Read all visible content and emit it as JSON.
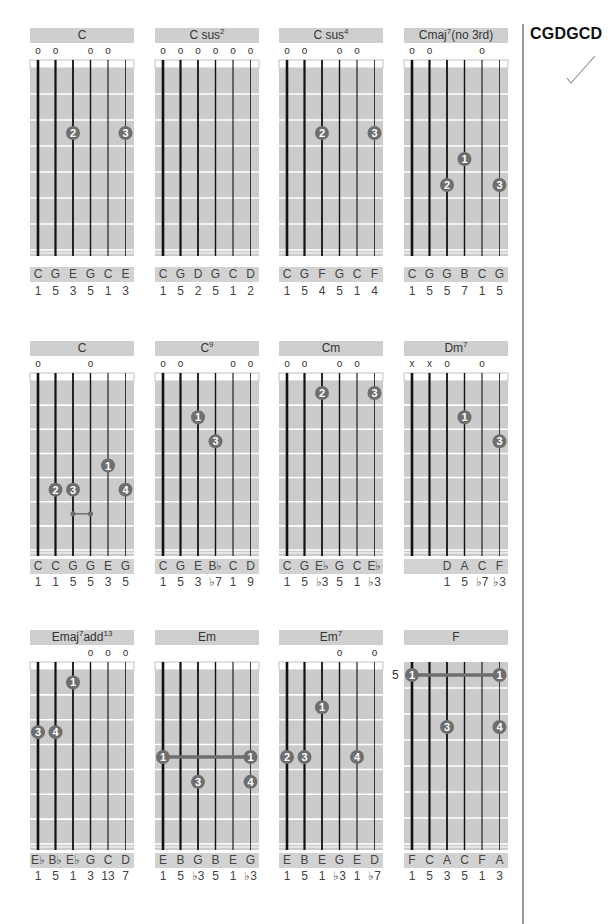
{
  "page": {
    "tuning_label": "CGDGCD",
    "check_icon": "checkmark-icon"
  },
  "colors": {
    "fretboard": "#cbcbcb",
    "title_bar": "#cfcfcf",
    "notes_bar": "#d2d2d2",
    "finger_dot": "#6e6e6e",
    "string": "#111111",
    "fret_line": "#ffffff",
    "divider": "#9a9a9a"
  },
  "chords": [
    {
      "name": "C",
      "sup": "",
      "suffix": "",
      "col": 0,
      "row": 0,
      "markers": [
        "o",
        "o",
        "",
        "o",
        "o",
        ""
      ],
      "fingers": [
        {
          "string": 3,
          "fret": 3,
          "label": "2"
        },
        {
          "string": 6,
          "fret": 3,
          "label": "3"
        }
      ],
      "barre": null,
      "slide": null,
      "fret_label": "",
      "notes": [
        "C",
        "G",
        "E",
        "G",
        "C",
        "E"
      ],
      "degrees": [
        "1",
        "5",
        "3",
        "5",
        "1",
        "3"
      ]
    },
    {
      "name": "C sus",
      "sup": "2",
      "suffix": "",
      "col": 1,
      "row": 0,
      "markers": [
        "o",
        "o",
        "o",
        "o",
        "o",
        "o"
      ],
      "fingers": [],
      "barre": null,
      "slide": null,
      "fret_label": "",
      "notes": [
        "C",
        "G",
        "D",
        "G",
        "C",
        "D"
      ],
      "degrees": [
        "1",
        "5",
        "2",
        "5",
        "1",
        "2"
      ]
    },
    {
      "name": "C sus",
      "sup": "4",
      "suffix": "",
      "col": 2,
      "row": 0,
      "markers": [
        "o",
        "o",
        "",
        "o",
        "o",
        ""
      ],
      "fingers": [
        {
          "string": 3,
          "fret": 3,
          "label": "2"
        },
        {
          "string": 6,
          "fret": 3,
          "label": "3"
        }
      ],
      "barre": null,
      "slide": null,
      "fret_label": "",
      "notes": [
        "C",
        "G",
        "F",
        "G",
        "C",
        "F"
      ],
      "degrees": [
        "1",
        "5",
        "4",
        "5",
        "1",
        "4"
      ]
    },
    {
      "name": "Cmaj",
      "sup": "7",
      "suffix": "(no 3rd)",
      "col": 3,
      "row": 0,
      "markers": [
        "o",
        "o",
        "",
        "",
        "o",
        ""
      ],
      "fingers": [
        {
          "string": 4,
          "fret": 4,
          "label": "1"
        },
        {
          "string": 3,
          "fret": 5,
          "label": "2"
        },
        {
          "string": 6,
          "fret": 5,
          "label": "3"
        }
      ],
      "barre": null,
      "slide": null,
      "fret_label": "",
      "notes": [
        "C",
        "G",
        "G",
        "B",
        "C",
        "G"
      ],
      "degrees": [
        "1",
        "5",
        "5",
        "7",
        "1",
        "5"
      ]
    },
    {
      "name": "C",
      "sup": "",
      "suffix": "",
      "col": 0,
      "row": 1,
      "markers": [
        "o",
        "",
        "",
        "o",
        "",
        ""
      ],
      "fingers": [
        {
          "string": 5,
          "fret": 4,
          "label": "1"
        },
        {
          "string": 2,
          "fret": 5,
          "label": "2"
        },
        {
          "string": 3,
          "fret": 5,
          "label": "3"
        },
        {
          "string": 6,
          "fret": 5,
          "label": "4"
        }
      ],
      "barre": null,
      "slide": {
        "from": 3,
        "to": 4,
        "fret": 6
      },
      "fret_label": "",
      "notes": [
        "C",
        "C",
        "G",
        "G",
        "E",
        "G"
      ],
      "degrees": [
        "1",
        "1",
        "5",
        "5",
        "3",
        "5"
      ]
    },
    {
      "name": "C",
      "sup": "9",
      "suffix": "",
      "col": 1,
      "row": 1,
      "markers": [
        "o",
        "o",
        "",
        "",
        "o",
        "o"
      ],
      "fingers": [
        {
          "string": 3,
          "fret": 2,
          "label": "1"
        },
        {
          "string": 4,
          "fret": 3,
          "label": "3"
        }
      ],
      "barre": null,
      "slide": null,
      "fret_label": "",
      "notes": [
        "C",
        "G",
        "E",
        "B♭",
        "C",
        "D"
      ],
      "degrees": [
        "1",
        "5",
        "3",
        "♭7",
        "1",
        "9"
      ]
    },
    {
      "name": "Cm",
      "sup": "",
      "suffix": "",
      "col": 2,
      "row": 1,
      "markers": [
        "o",
        "o",
        "",
        "o",
        "o",
        ""
      ],
      "fingers": [
        {
          "string": 3,
          "fret": 1,
          "label": "2"
        },
        {
          "string": 6,
          "fret": 1,
          "label": "3"
        }
      ],
      "barre": null,
      "slide": null,
      "fret_label": "",
      "notes": [
        "C",
        "G",
        "E♭",
        "G",
        "C",
        "E♭"
      ],
      "degrees": [
        "1",
        "5",
        "♭3",
        "5",
        "1",
        "♭3"
      ]
    },
    {
      "name": "Dm",
      "sup": "7",
      "suffix": "",
      "col": 3,
      "row": 1,
      "markers": [
        "x",
        "x",
        "o",
        "",
        "o",
        ""
      ],
      "fingers": [
        {
          "string": 4,
          "fret": 2,
          "label": "1"
        },
        {
          "string": 6,
          "fret": 3,
          "label": "3"
        }
      ],
      "barre": null,
      "slide": null,
      "fret_label": "",
      "notes": [
        "",
        "",
        "D",
        "A",
        "C",
        "F"
      ],
      "degrees": [
        "",
        "",
        "1",
        "5",
        "♭7",
        "♭3"
      ]
    },
    {
      "name": "Emaj",
      "sup": "7",
      "suffix": "add",
      "sup2": "13",
      "col": 0,
      "row": 2,
      "markers": [
        "",
        "",
        "",
        "o",
        "o",
        "o"
      ],
      "fingers": [
        {
          "string": 3,
          "fret": 1,
          "label": "1"
        },
        {
          "string": 1,
          "fret": 3,
          "label": "3"
        },
        {
          "string": 2,
          "fret": 3,
          "label": "4"
        }
      ],
      "barre": null,
      "slide": null,
      "fret_label": "",
      "notes": [
        "E♭",
        "B♭",
        "E♭",
        "G",
        "C",
        "D"
      ],
      "degrees": [
        "1",
        "5",
        "1",
        "3",
        "13",
        "7"
      ]
    },
    {
      "name": "Em",
      "sup": "",
      "suffix": "",
      "col": 1,
      "row": 2,
      "markers": [
        "",
        "",
        "",
        "",
        "",
        ""
      ],
      "fingers": [
        {
          "string": 3,
          "fret": 5,
          "label": "3"
        },
        {
          "string": 6,
          "fret": 5,
          "label": "4"
        }
      ],
      "barre": {
        "from": 1,
        "to": 6,
        "fret": 4,
        "label": "1"
      },
      "slide": null,
      "fret_label": "",
      "notes": [
        "E",
        "B",
        "G",
        "B",
        "E",
        "G"
      ],
      "degrees": [
        "1",
        "5",
        "♭3",
        "5",
        "1",
        "♭3"
      ]
    },
    {
      "name": "Em",
      "sup": "7",
      "suffix": "",
      "col": 2,
      "row": 2,
      "markers": [
        "",
        "",
        "",
        "o",
        "",
        "o"
      ],
      "fingers": [
        {
          "string": 3,
          "fret": 2,
          "label": "1"
        },
        {
          "string": 1,
          "fret": 4,
          "label": "2"
        },
        {
          "string": 2,
          "fret": 4,
          "label": "3"
        },
        {
          "string": 5,
          "fret": 4,
          "label": "4"
        }
      ],
      "barre": null,
      "slide": null,
      "fret_label": "",
      "notes": [
        "E",
        "B",
        "E",
        "G",
        "E",
        "D"
      ],
      "degrees": [
        "1",
        "5",
        "1",
        "♭3",
        "1",
        "♭7"
      ]
    },
    {
      "name": "F",
      "sup": "",
      "suffix": "",
      "col": 3,
      "row": 2,
      "markers": [
        "",
        "",
        "",
        "",
        "",
        ""
      ],
      "fingers": [
        {
          "string": 3,
          "fret": 3,
          "label": "3"
        },
        {
          "string": 6,
          "fret": 3,
          "label": "4"
        }
      ],
      "barre": {
        "from": 1,
        "to": 6,
        "fret": 1,
        "label": "1"
      },
      "slide": null,
      "fret_label": "5",
      "no_nut": true,
      "notes": [
        "F",
        "C",
        "A",
        "C",
        "F",
        "A"
      ],
      "degrees": [
        "1",
        "5",
        "3",
        "5",
        "1",
        "3"
      ]
    }
  ]
}
